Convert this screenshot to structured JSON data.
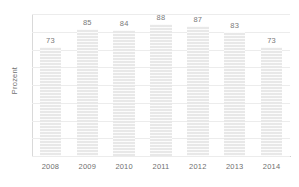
{
  "chart_data": {
    "type": "bar",
    "title": "",
    "subtitle": "",
    "xlabel": "",
    "ylabel": "Prozent",
    "categories": [
      "2008",
      "2009",
      "2010",
      "2011",
      "2012",
      "2013",
      "2014"
    ],
    "values": [
      73,
      85,
      84,
      88,
      87,
      83,
      73
    ],
    "value_labels": [
      "73",
      "85",
      "84",
      "88",
      "87",
      "83",
      "73"
    ],
    "ylim": [
      0,
      95
    ],
    "y_tick_labels": [],
    "grid": true,
    "grid_orientation": "horizontal",
    "legend": false,
    "legend_position": "none",
    "series": [
      {
        "name": "Prozent",
        "values": [
          73,
          85,
          84,
          88,
          87,
          83,
          73
        ]
      }
    ],
    "colors": {
      "bar_fill": "#e8e8e8",
      "bar_stripe": "#ffffff",
      "gridline": "#ececec",
      "axis_line": "#d0d0d0",
      "label_text": "#7a7a7a",
      "axis_title_text": "#6f6f6f",
      "background": "#ffffff"
    }
  }
}
